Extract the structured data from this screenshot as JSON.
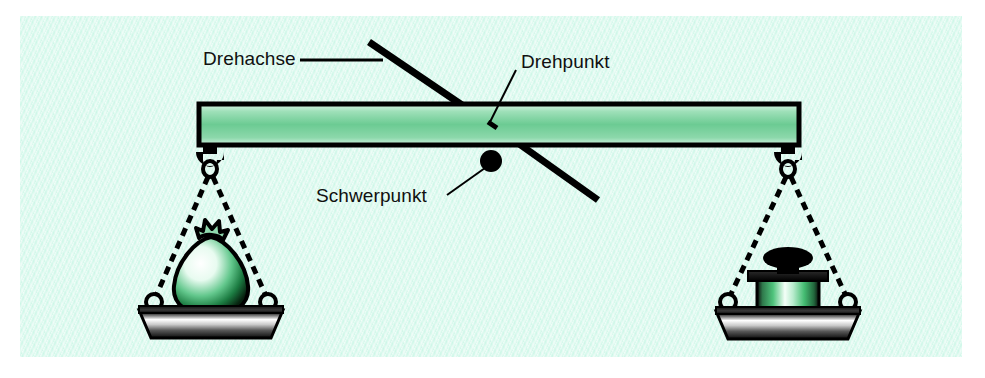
{
  "figure": {
    "background_color": "#d4f7ea",
    "page_color": "#ffffff"
  },
  "labels": {
    "drehachse": "Drehachse",
    "drehpunkt": "Drehpunkt",
    "schwerpunkt": "Schwerpunkt"
  },
  "colors": {
    "beam_fill_light": "#d7f5e4",
    "beam_fill_mid": "#63c98d",
    "outline": "#000000",
    "metal_light": "#f2f2f2",
    "metal_dark": "#1a1a1a",
    "weight_green": "#3fbe6e"
  },
  "parts": {
    "beam": "balance-beam",
    "pivot_rod": "rotation-axis-rod",
    "pivot_point": "pivot-point",
    "center_of_mass_dot": "center-of-mass-dot",
    "left_load": "sack-weight",
    "right_load": "cylinder-weight",
    "left_pan": "left-scale-pan",
    "right_pan": "right-scale-pan",
    "left_hook": "left-hook",
    "right_hook": "right-hook"
  }
}
